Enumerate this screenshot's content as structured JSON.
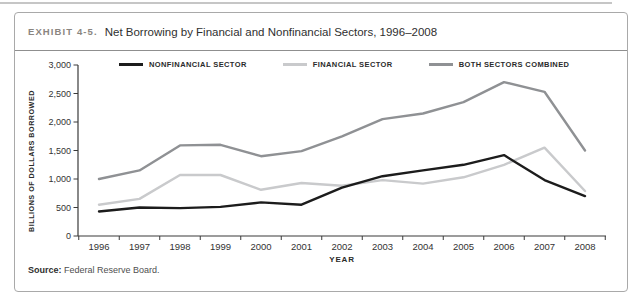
{
  "page": {
    "title_kicker": "EXHIBIT 4-5.",
    "title": "Net Borrowing by Financial and Nonfinancial Sectors, 1996–2008",
    "source_label": "Source:",
    "source_text": "Federal Reserve Board."
  },
  "colors": {
    "border": "#a9a9a9",
    "axis": "#3a3a3a",
    "tick_text": "#333333",
    "nonfinancial": "#1c1c1c",
    "financial": "#c9cacc",
    "combined": "#8f9194"
  },
  "chart_data": {
    "type": "line",
    "title": "Net Borrowing by Financial and Nonfinancial Sectors, 1996–2008",
    "xlabel": "YEAR",
    "ylabel": "BILLIONS OF DOLLARS BORROWED",
    "categories": [
      "1996",
      "1997",
      "1998",
      "1999",
      "2000",
      "2001",
      "2002",
      "2003",
      "2004",
      "2005",
      "2006",
      "2007",
      "2008"
    ],
    "series": [
      {
        "name": "NONFINANCIAL SECTOR",
        "color": "#1c1c1c",
        "values": [
          430,
          500,
          490,
          510,
          590,
          550,
          850,
          1050,
          1150,
          1250,
          1420,
          980,
          700
        ]
      },
      {
        "name": "FINANCIAL SECTOR",
        "color": "#c9cacc",
        "values": [
          550,
          650,
          1070,
          1070,
          810,
          930,
          880,
          980,
          920,
          1030,
          1250,
          1550,
          790
        ]
      },
      {
        "name": "BOTH SECTORS COMBINED",
        "color": "#8f9194",
        "values": [
          1000,
          1150,
          1590,
          1600,
          1400,
          1490,
          1750,
          2050,
          2150,
          2350,
          2700,
          2530,
          1500
        ]
      }
    ],
    "ylim": [
      0,
      3000
    ],
    "yticks": [
      0,
      500,
      1000,
      1500,
      2000,
      2500,
      3000
    ],
    "ytick_labels": [
      "0",
      "500",
      "1,000",
      "1,500",
      "2,000",
      "2,500",
      "3,000"
    ],
    "grid": false,
    "legend_position": "top-inside"
  }
}
